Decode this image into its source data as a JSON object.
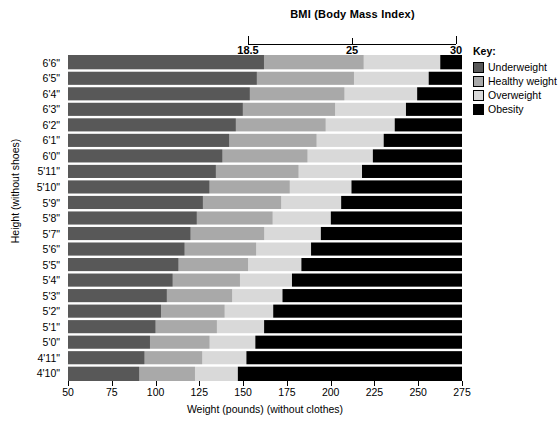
{
  "chart_data": {
    "type": "area",
    "title": "BMI (Body Mass Index)",
    "xlabel": "Weight (pounds) (without clothes)",
    "ylabel": "Height (without shoes)",
    "xlim": [
      50,
      275
    ],
    "ylim_categories": [
      "4'10\"",
      "6'6\""
    ],
    "grid": true,
    "legend_position": "right",
    "x_ticks": [
      50,
      75,
      100,
      125,
      150,
      175,
      200,
      225,
      250,
      275
    ],
    "x_tick_labels": [
      "50",
      "75",
      "100",
      "125",
      "150",
      "175",
      "200",
      "225",
      "250",
      "275"
    ],
    "bmi_ticks": [
      18.5,
      25,
      30
    ],
    "bmi_tick_labels": [
      "18.5",
      "25",
      "30"
    ],
    "heights": [
      "6'6\"",
      "6'5\"",
      "6'4\"",
      "6'3\"",
      "6'2\"",
      "6'1\"",
      "6'0\"",
      "5'11\"",
      "5'10\"",
      "5'9\"",
      "5'8\"",
      "5'7\"",
      "5'6\"",
      "5'5\"",
      "5'4\"",
      "5'3\"",
      "5'2\"",
      "5'1\"",
      "5'0\"",
      "4'11\"",
      "4'10\""
    ],
    "height_inches": [
      78,
      77,
      76,
      75,
      74,
      73,
      72,
      71,
      70,
      69,
      68,
      67,
      66,
      65,
      64,
      63,
      62,
      61,
      60,
      59,
      58
    ],
    "categories": [
      "Underweight",
      "Healthy weight",
      "Overweight",
      "Obesity"
    ],
    "band_bmi_breaks": [
      18.5,
      25,
      30
    ],
    "series": [
      {
        "name": "Underweight",
        "bmi_range": [
          0,
          18.5
        ],
        "color": "#585858",
        "weight_bounds_lb": [
          161.9,
          157.8,
          153.8,
          149.8,
          145.8,
          142.0,
          138.1,
          134.4,
          130.7,
          127.0,
          123.5,
          119.9,
          116.5,
          113.0,
          109.7,
          106.4,
          103.1,
          99.9,
          96.8,
          93.6,
          90.6
        ]
      },
      {
        "name": "Healthy weight",
        "bmi_range": [
          18.5,
          25
        ],
        "color": "#a9a9a9",
        "weight_bounds_lb": [
          218.8,
          213.3,
          207.8,
          202.5,
          197.1,
          191.9,
          186.7,
          181.6,
          176.6,
          171.7,
          166.8,
          162.0,
          157.4,
          152.8,
          148.2,
          143.7,
          139.4,
          135.0,
          130.8,
          126.6,
          122.5
        ]
      },
      {
        "name": "Overweight",
        "bmi_range": [
          25,
          30
        ],
        "color": "#d9d9d9",
        "weight_bounds_lb": [
          262.6,
          256.0,
          249.4,
          243.0,
          236.6,
          230.3,
          224.1,
          217.9,
          211.9,
          206.0,
          200.1,
          194.4,
          188.8,
          183.3,
          177.9,
          172.5,
          167.2,
          162.0,
          157.0,
          151.9,
          147.0
        ]
      },
      {
        "name": "Obesity",
        "bmi_range": [
          30,
          99
        ],
        "color": "#000000",
        "weight_bounds_lb": [
          275,
          275,
          275,
          275,
          275,
          275,
          275,
          275,
          275,
          275,
          275,
          275,
          275,
          275,
          275,
          275,
          275,
          275,
          275,
          275,
          275
        ]
      }
    ]
  },
  "bmi_axis": {
    "title": "BMI (Body Mass Index)",
    "labels": [
      "18.5",
      "25",
      "30"
    ]
  },
  "axes": {
    "x_title": "Weight (pounds) (without clothes)",
    "y_title": "Height (without shoes)"
  },
  "key": {
    "title": "Key:",
    "items": [
      {
        "label": "Underweight",
        "color": "#585858"
      },
      {
        "label": "Healthy weight",
        "color": "#a9a9a9"
      },
      {
        "label": "Overweight",
        "color": "#d9d9d9"
      },
      {
        "label": "Obesity",
        "color": "#000000"
      }
    ]
  }
}
